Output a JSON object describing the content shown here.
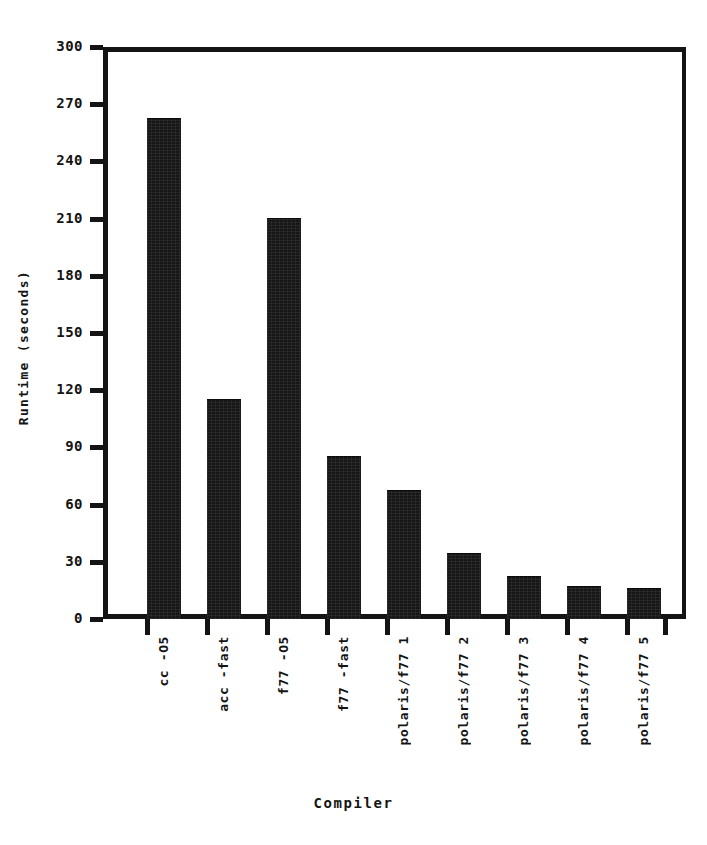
{
  "chart_data": {
    "type": "bar",
    "title": "",
    "xlabel": "Compiler",
    "ylabel": "Runtime (seconds)",
    "categories": [
      "cc -O5",
      "acc -fast",
      "f77 -O5",
      "f77 -fast",
      "polaris/f77 1",
      "polaris/f77 2",
      "polaris/f77 3",
      "polaris/f77 4",
      "polaris/f77 5"
    ],
    "values": [
      262,
      115,
      210,
      85,
      67,
      34,
      22,
      17,
      16
    ],
    "ylim": [
      0,
      300
    ],
    "yticks": [
      0,
      30,
      60,
      90,
      120,
      150,
      180,
      210,
      240,
      270,
      300
    ],
    "ytick_labels": [
      "0",
      "30",
      "60",
      "90",
      "120",
      "150",
      "180",
      "210",
      "240",
      "270",
      "300"
    ],
    "grid": false,
    "legend": null,
    "bar_color": "#171717",
    "axis_color": "#141414",
    "background_color": "#ffffff"
  }
}
